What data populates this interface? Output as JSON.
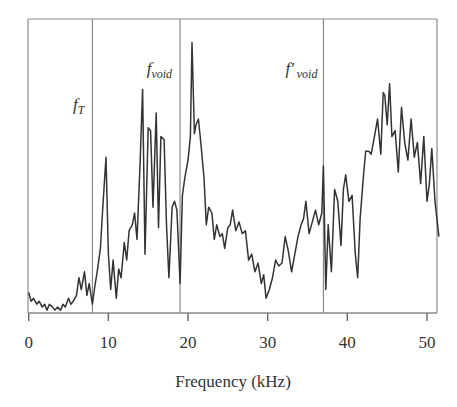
{
  "chart_data": {
    "type": "line",
    "title": "",
    "xlabel": "Frequency (kHz)",
    "ylabel": "",
    "xlim": [
      0,
      51.5
    ],
    "ylim": [
      0,
      100
    ],
    "grid": false,
    "legend": null,
    "x_ticks": [
      0,
      10,
      20,
      30,
      40,
      50
    ],
    "x_tick_labels": [
      "0",
      "10",
      "20",
      "30",
      "40",
      "50"
    ],
    "y_ticks": [],
    "markers": [
      {
        "label": "f",
        "subscript": "T",
        "prime": false,
        "x": 8.0
      },
      {
        "label": "f",
        "subscript": "void",
        "prime": false,
        "x": 19.0
      },
      {
        "label": "f'",
        "subscript": "void",
        "prime": true,
        "x": 37.0
      }
    ],
    "series": [
      {
        "name": "spectrum",
        "color": "#333333",
        "x": [
          0,
          0.3,
          0.6,
          1.0,
          1.3,
          1.7,
          2.0,
          2.3,
          2.6,
          3.0,
          3.3,
          3.6,
          4.0,
          4.3,
          4.6,
          5.0,
          5.3,
          5.6,
          6.0,
          6.3,
          6.6,
          7.0,
          7.3,
          7.6,
          8.0,
          8.3,
          8.6,
          9.0,
          9.3,
          9.7,
          10.0,
          10.3,
          10.6,
          11.0,
          11.3,
          11.6,
          12.0,
          12.3,
          12.6,
          13.0,
          13.3,
          13.6,
          14.0,
          14.3,
          14.6,
          15.0,
          15.3,
          15.6,
          16.0,
          16.3,
          16.6,
          17.0,
          17.3,
          17.6,
          18.0,
          18.3,
          18.6,
          19.0,
          19.3,
          19.6,
          20.0,
          20.3,
          20.5,
          20.8,
          21.0,
          21.3,
          21.6,
          22.0,
          22.3,
          22.6,
          23.0,
          23.3,
          23.6,
          24.0,
          24.3,
          24.6,
          25.0,
          25.3,
          25.6,
          26.0,
          26.4,
          26.8,
          27.2,
          27.6,
          28.0,
          28.4,
          28.8,
          29.2,
          29.5,
          29.8,
          30.2,
          30.6,
          31.0,
          31.4,
          31.8,
          32.2,
          32.6,
          33.0,
          33.4,
          33.8,
          34.2,
          34.5,
          34.8,
          35.2,
          35.6,
          36.0,
          36.4,
          36.8,
          37.0,
          37.3,
          37.6,
          38.0,
          38.4,
          38.8,
          39.2,
          39.5,
          39.8,
          40.2,
          40.6,
          41.0,
          41.3,
          41.6,
          42.0,
          42.3,
          42.7,
          43.0,
          43.4,
          43.8,
          44.2,
          44.5,
          44.7,
          45.0,
          45.3,
          45.6,
          46.0,
          46.4,
          46.8,
          47.2,
          47.6,
          48.0,
          48.4,
          48.8,
          49.2,
          49.6,
          50.0,
          50.3,
          50.6,
          51.0,
          51.5
        ],
        "values": [
          7,
          4,
          5,
          3,
          4,
          2,
          3,
          1,
          3,
          2,
          1,
          2,
          1,
          3,
          2,
          5,
          3,
          4,
          6,
          12,
          8,
          14,
          6,
          10,
          3,
          9,
          14,
          22,
          36,
          53,
          20,
          8,
          18,
          5,
          15,
          12,
          24,
          18,
          28,
          30,
          34,
          25,
          52,
          76,
          20,
          63,
          62,
          36,
          68,
          29,
          60,
          59,
          30,
          12,
          36,
          38,
          35,
          10,
          40,
          46,
          52,
          60,
          92,
          61,
          64,
          66,
          58,
          46,
          30,
          36,
          34,
          25,
          30,
          26,
          27,
          22,
          29,
          30,
          35,
          28,
          31,
          27,
          28,
          18,
          20,
          14,
          17,
          10,
          13,
          5,
          8,
          12,
          18,
          16,
          17,
          26,
          21,
          14,
          20,
          26,
          30,
          32,
          38,
          27,
          31,
          35,
          30,
          34,
          50,
          8,
          30,
          14,
          42,
          38,
          23,
          42,
          47,
          38,
          40,
          20,
          12,
          32,
          46,
          55,
          55,
          54,
          60,
          66,
          54,
          75,
          74,
          64,
          78,
          60,
          62,
          48,
          70,
          58,
          52,
          66,
          53,
          58,
          44,
          60,
          38,
          44,
          56,
          38,
          26
        ],
        "notes": "Relative amplitude (unlabeled y-axis), estimated from pixel positions; 100 = top of frame."
      }
    ]
  }
}
